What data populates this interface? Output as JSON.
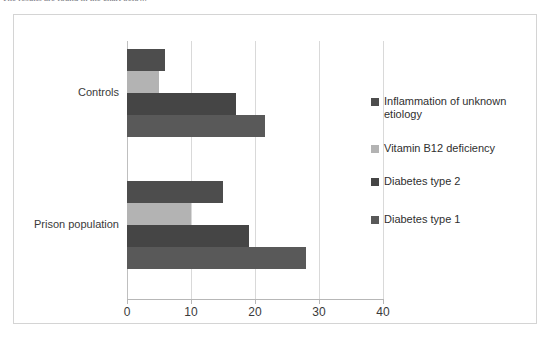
{
  "caption": {
    "text": "The results are found in the chart below."
  },
  "chart_data": {
    "type": "bar",
    "orientation": "horizontal",
    "title": "",
    "xlabel": "",
    "ylabel": "",
    "categories": [
      "Controls",
      "Prison population"
    ],
    "xlim": [
      0,
      40
    ],
    "xticks": [
      0,
      10,
      20,
      30,
      40
    ],
    "xtick_labels": [
      "0",
      "10",
      "20",
      "30",
      "40"
    ],
    "grid": "vertical",
    "legend_position": "right",
    "series": [
      {
        "name": "Inflammation of unknown etiology",
        "color": "#4d4d4d",
        "values": [
          6,
          15
        ]
      },
      {
        "name": "Vitamin B12 deficiency",
        "color": "#b3b3b3",
        "values": [
          5,
          10
        ]
      },
      {
        "name": "Diabetes type 2",
        "color": "#454545",
        "values": [
          17,
          19
        ]
      },
      {
        "name": "Diabetes type 1",
        "color": "#595959",
        "values": [
          21.5,
          28
        ]
      }
    ]
  },
  "legend": {
    "items": [
      {
        "label": "Inflammation of unknown etiology",
        "color": "#4d4d4d"
      },
      {
        "label": "Vitamin B12 deficiency",
        "color": "#b3b3b3"
      },
      {
        "label": "Diabetes type 2",
        "color": "#454545"
      },
      {
        "label": "Diabetes type 1",
        "color": "#595959"
      }
    ]
  }
}
